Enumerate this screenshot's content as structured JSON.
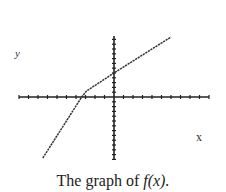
{
  "chart_data": {
    "type": "line",
    "title": "",
    "caption_prefix": "The graph of",
    "caption_func": "f(x).",
    "xlabel": "x",
    "ylabel": "y",
    "grid": false,
    "x_ticks_each_side": 10,
    "y_ticks_up": 12,
    "y_ticks_down": 13,
    "series": [
      {
        "name": "f(x)",
        "style": "dashed-ish dark line",
        "x": [
          -7.5,
          -3.4,
          -2.9,
          0,
          6
        ],
        "y": [
          -12.7,
          0,
          1.25,
          5,
          12.5
        ]
      }
    ],
    "xlim": [
      -10,
      10
    ],
    "ylim": [
      -13,
      13
    ],
    "annotations": [
      "piecewise linear: steep segment left of bend, shallower segment right of bend"
    ]
  },
  "labels": {
    "x": "x",
    "y": "y"
  },
  "caption": {
    "prefix": "The graph of",
    "func": "f(x)."
  },
  "colors": {
    "axis": "#222222",
    "curve": "#333333",
    "background": "#ffffff"
  }
}
